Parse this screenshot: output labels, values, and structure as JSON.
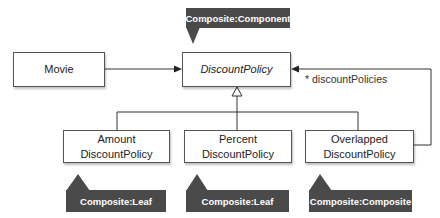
{
  "diagram": {
    "type": "UML class diagram (Composite pattern)",
    "classes": [
      {
        "id": "movie",
        "label": "Movie",
        "italic": false
      },
      {
        "id": "discount_policy",
        "label": "DiscountPolicy",
        "italic": true
      },
      {
        "id": "amount",
        "label": "Amount\nDiscountPolicy",
        "italic": false
      },
      {
        "id": "percent",
        "label": "Percent\nDiscountPolicy",
        "italic": false
      },
      {
        "id": "overlapped",
        "label": "Overlapped\nDiscountPolicy",
        "italic": false
      }
    ],
    "tags": [
      {
        "id": "component_tag",
        "label": "Composite:Component",
        "target": "discount_policy"
      },
      {
        "id": "leaf_tag_1",
        "label": "Composite:Leaf",
        "target": "amount"
      },
      {
        "id": "leaf_tag_2",
        "label": "Composite:Leaf",
        "target": "percent"
      },
      {
        "id": "composite_tag",
        "label": "Composite:Composite",
        "target": "overlapped"
      }
    ],
    "relations": [
      {
        "from": "movie",
        "to": "discount_policy",
        "kind": "association"
      },
      {
        "from": "amount",
        "to": "discount_policy",
        "kind": "generalization"
      },
      {
        "from": "percent",
        "to": "discount_policy",
        "kind": "generalization"
      },
      {
        "from": "overlapped",
        "to": "discount_policy",
        "kind": "generalization"
      },
      {
        "from": "overlapped",
        "to": "discount_policy",
        "kind": "association",
        "label": "* discountPolicies"
      }
    ],
    "colors": {
      "tag_fill": "#4a4a4a",
      "tag_text": "#ffffff",
      "line": "#333333",
      "box_border": "#555555"
    }
  }
}
